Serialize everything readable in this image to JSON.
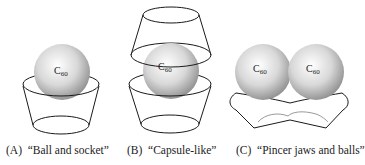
{
  "panels": [
    {
      "letter": "(A)",
      "caption": "“Ball and socket”",
      "balls": [
        "C60"
      ]
    },
    {
      "letter": "(B)",
      "caption": "“Capsule-like”",
      "balls": [
        "C60"
      ]
    },
    {
      "letter": "(C)",
      "caption": "“Pincer jaws and balls”",
      "balls": [
        "C60",
        "C60"
      ]
    }
  ],
  "ball_label": {
    "base": "C",
    "sub": "60"
  },
  "colors": {
    "line": "#1a1a1a",
    "ball_light": "#ffffff",
    "ball_dark": "#9a9a9a",
    "pincer_inner": "#999999"
  }
}
